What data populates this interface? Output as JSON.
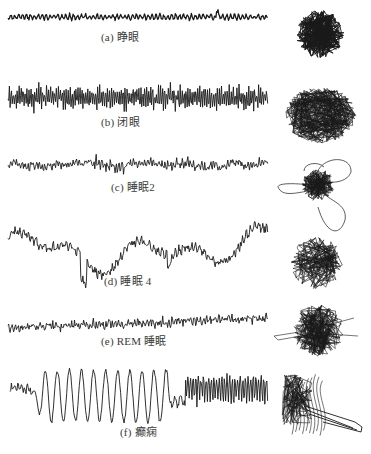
{
  "figure": {
    "ink_color": "#1a1a1a",
    "background": "#ffffff"
  },
  "panels": [
    {
      "id": "a",
      "label": "(a) 睁眼",
      "state": "eyes open",
      "label_pos": [
        101,
        37
      ],
      "wave": {
        "y": 17,
        "x0": 8,
        "x1": 268,
        "amp": 2.5,
        "freq": 1.6,
        "noise": 1.8,
        "seed": 3,
        "type": "flat"
      },
      "attractor": {
        "cx": 320,
        "cy": 34,
        "r": 24,
        "type": "dense",
        "seed": 11,
        "lines": 260
      }
    },
    {
      "id": "b",
      "label": "(b) 闭眼",
      "state": "eyes closed",
      "label_pos": [
        101,
        122
      ],
      "wave": {
        "y": 98,
        "x0": 8,
        "x1": 268,
        "amp": 11,
        "freq": 3.2,
        "noise": 4,
        "seed": 7,
        "type": "alpha"
      },
      "attractor": {
        "cx": 320,
        "cy": 115,
        "r": 34,
        "type": "ring",
        "seed": 13,
        "lines": 320
      }
    },
    {
      "id": "c",
      "label": "(c) 睡眠2",
      "state": "sleep stage 2",
      "label_pos": [
        111,
        187
      ],
      "wave": {
        "y": 165,
        "x0": 8,
        "x1": 268,
        "amp": 7,
        "freq": 2.2,
        "noise": 5,
        "seed": 17,
        "type": "spindle"
      },
      "attractor": {
        "cx": 318,
        "cy": 185,
        "r": 18,
        "type": "petals",
        "seed": 19,
        "lines": 180
      }
    },
    {
      "id": "d",
      "label": "(d) 睡眠 4",
      "state": "sleep stage 4",
      "label_pos": [
        104,
        281
      ],
      "wave": {
        "y": 250,
        "x0": 8,
        "x1": 268,
        "amp": 22,
        "freq": 0.5,
        "noise": 4,
        "seed": 23,
        "type": "delta"
      },
      "attractor": {
        "cx": 317,
        "cy": 263,
        "r": 26,
        "type": "sparse",
        "seed": 29,
        "lines": 170
      }
    },
    {
      "id": "e",
      "label": "(e) REM 睡眠",
      "state": "REM sleep",
      "label_pos": [
        101,
        341
      ],
      "wave": {
        "y": 323,
        "x0": 8,
        "x1": 268,
        "amp": 4,
        "freq": 2.0,
        "noise": 3.2,
        "seed": 31,
        "type": "rem"
      },
      "attractor": {
        "cx": 318,
        "cy": 330,
        "r": 26,
        "type": "dense-loose",
        "seed": 37,
        "lines": 230
      }
    },
    {
      "id": "f",
      "label": "(f) 癫痫",
      "state": "epilepsy",
      "label_pos": [
        120,
        432
      ],
      "wave": {
        "y": 390,
        "x0": 10,
        "x1": 268,
        "amp": 28,
        "freq": 0,
        "noise": 3,
        "seed": 41,
        "type": "seizure"
      },
      "attractor": {
        "cx": 305,
        "cy": 400,
        "r": 22,
        "type": "seizure",
        "seed": 43,
        "lines": 120
      }
    }
  ]
}
